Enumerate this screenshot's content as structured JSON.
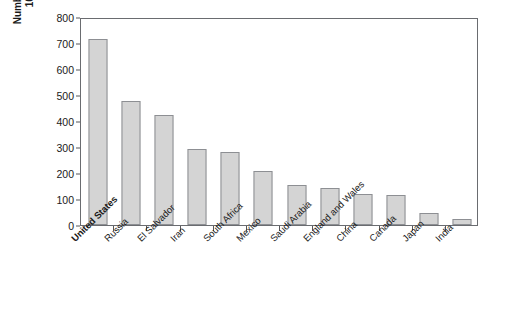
{
  "chart_data": {
    "type": "bar",
    "title": "",
    "subtitle": "",
    "xlabel": "",
    "ylabel": "Number of people incarcerated per 100,000 national population",
    "ylabel_line1": "Number of people incarcerated per",
    "ylabel_line2": "100,000 national population",
    "ylim": [
      0,
      800
    ],
    "yticks": [
      0,
      100,
      200,
      300,
      400,
      500,
      600,
      700,
      800
    ],
    "ytick_labels": [
      "0",
      "100",
      "200",
      "300",
      "400",
      "500",
      "600",
      "700",
      "800"
    ],
    "grid": false,
    "legend": "none",
    "bar_fill": "#d4d4d4",
    "bar_stroke": "#8d8f93",
    "frame_color": "#6a6c70",
    "emphasized_category": "United States",
    "categories": [
      "United States",
      "Russia",
      "El Salvador",
      "Iran",
      "South Africa",
      "Mexico",
      "Saudi Arabia",
      "England and Wales",
      "China",
      "Canada",
      "Japan",
      "India"
    ],
    "values": [
      715,
      477,
      422,
      292,
      282,
      208,
      155,
      142,
      118,
      116,
      48,
      22
    ]
  }
}
